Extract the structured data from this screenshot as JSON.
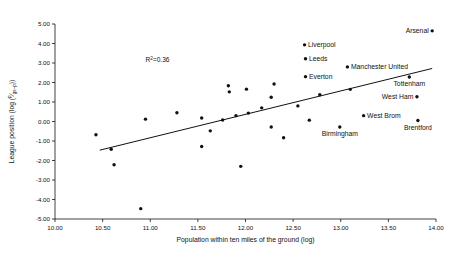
{
  "chart_data": {
    "type": "scatter",
    "title": "",
    "xlabel": "Population within ten miles of the ground (log)",
    "ylabel": "League position (log (p/(gs-p)))",
    "ylabel_parts": {
      "prefix": "League position (log (",
      "numerator": "p",
      "denominator": "gs–p",
      "suffix": "))"
    },
    "xlim": [
      10.0,
      14.0
    ],
    "ylim": [
      -5.0,
      5.0
    ],
    "xticks": [
      "10.00",
      "10.50",
      "11.00",
      "11.50",
      "12.00",
      "12.50",
      "13.00",
      "13.50",
      "14.00"
    ],
    "xtick_values": [
      10.0,
      10.5,
      11.0,
      11.5,
      12.0,
      12.5,
      13.0,
      13.5,
      14.0
    ],
    "yticks": [
      "5.00",
      "4.00",
      "3.00",
      "2.00",
      "1.00",
      "0.00",
      "-1.00",
      "-2.00",
      "-3.00",
      "-4.00",
      "-5.00"
    ],
    "ytick_values": [
      5.0,
      4.0,
      3.0,
      2.0,
      1.0,
      0.0,
      -1.0,
      -2.0,
      -3.0,
      -4.0,
      -5.0
    ],
    "grid": false,
    "legend": "none",
    "annotation": {
      "text_prefix": "R",
      "text_superscript": "2",
      "text_suffix": "=0.36",
      "full_text": "R²=0.36",
      "x": 10.95,
      "y": 3.05
    },
    "trendline": {
      "x0": 10.47,
      "y0": -1.47,
      "x1": 13.96,
      "y1": 2.72,
      "label": "linear fit"
    },
    "points": [
      {
        "x": 13.96,
        "y": 4.65,
        "label": "Arsenal",
        "label_side": "left"
      },
      {
        "x": 12.62,
        "y": 3.93,
        "label": "Liverpool",
        "label_side": "right"
      },
      {
        "x": 12.63,
        "y": 3.22,
        "label": "Leeds",
        "label_side": "right"
      },
      {
        "x": 13.07,
        "y": 2.8,
        "label": "Manchester United",
        "label_side": "right"
      },
      {
        "x": 12.63,
        "y": 2.3,
        "label": "Everton",
        "label_side": "right"
      },
      {
        "x": 13.72,
        "y": 2.28,
        "label": "Tottenham",
        "label_side": "below"
      },
      {
        "x": 13.8,
        "y": 1.27,
        "label": "West Ham",
        "label_side": "left"
      },
      {
        "x": 13.24,
        "y": 0.3,
        "label": "West Brom",
        "label_side": "right"
      },
      {
        "x": 13.81,
        "y": 0.05,
        "label": "Brentford",
        "label_side": "below"
      },
      {
        "x": 12.99,
        "y": -0.28,
        "label": "Birmingham",
        "label_side": "below"
      },
      {
        "x": 10.43,
        "y": -0.68,
        "label": "",
        "label_side": ""
      },
      {
        "x": 10.59,
        "y": -1.42,
        "label": "",
        "label_side": ""
      },
      {
        "x": 10.62,
        "y": -2.22,
        "label": "",
        "label_side": ""
      },
      {
        "x": 10.9,
        "y": -4.47,
        "label": "",
        "label_side": ""
      },
      {
        "x": 10.95,
        "y": 0.12,
        "label": "",
        "label_side": ""
      },
      {
        "x": 11.28,
        "y": 0.45,
        "label": "",
        "label_side": ""
      },
      {
        "x": 11.54,
        "y": 0.18,
        "label": "",
        "label_side": ""
      },
      {
        "x": 11.54,
        "y": -1.28,
        "label": "",
        "label_side": ""
      },
      {
        "x": 11.63,
        "y": -0.48,
        "label": "",
        "label_side": ""
      },
      {
        "x": 11.76,
        "y": 0.08,
        "label": "",
        "label_side": ""
      },
      {
        "x": 11.82,
        "y": 1.83,
        "label": "",
        "label_side": ""
      },
      {
        "x": 11.83,
        "y": 1.52,
        "label": "",
        "label_side": ""
      },
      {
        "x": 11.9,
        "y": 0.3,
        "label": "",
        "label_side": ""
      },
      {
        "x": 11.95,
        "y": -2.3,
        "label": "",
        "label_side": ""
      },
      {
        "x": 12.01,
        "y": 1.66,
        "label": "",
        "label_side": ""
      },
      {
        "x": 12.03,
        "y": 0.43,
        "label": "",
        "label_side": ""
      },
      {
        "x": 12.17,
        "y": 0.7,
        "label": "",
        "label_side": ""
      },
      {
        "x": 12.27,
        "y": 1.24,
        "label": "",
        "label_side": ""
      },
      {
        "x": 12.27,
        "y": -0.28,
        "label": "",
        "label_side": ""
      },
      {
        "x": 12.3,
        "y": 1.92,
        "label": "",
        "label_side": ""
      },
      {
        "x": 12.4,
        "y": -0.83,
        "label": "",
        "label_side": ""
      },
      {
        "x": 12.55,
        "y": 0.8,
        "label": "",
        "label_side": ""
      },
      {
        "x": 12.67,
        "y": 0.07,
        "label": "",
        "label_side": ""
      },
      {
        "x": 12.78,
        "y": 1.37,
        "label": "",
        "label_side": ""
      },
      {
        "x": 13.1,
        "y": 1.65,
        "label": "",
        "label_side": ""
      }
    ]
  },
  "colors": {
    "axis": "#111111",
    "point": "#111111",
    "trendline": "#111111",
    "background": "#ffffff"
  }
}
